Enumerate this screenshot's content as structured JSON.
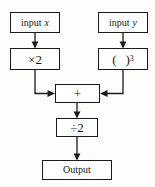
{
  "diagram": {
    "type": "flowchart",
    "stroke_color": "#1b1b1b",
    "background_color": "#fdfdfc",
    "nodes": {
      "input_x": {
        "label_prefix": "input",
        "variable": "x"
      },
      "input_y": {
        "label_prefix": "input",
        "variable": "y"
      },
      "times_two": {
        "label": "×2"
      },
      "cube": {
        "open_paren": "(",
        "close_paren": ")",
        "exponent": "3"
      },
      "sum": {
        "label": "+"
      },
      "divide": {
        "label": "÷2"
      },
      "output": {
        "label": "Output"
      }
    },
    "edges": [
      {
        "from": "input_x",
        "to": "times_two",
        "style": "arrow-down"
      },
      {
        "from": "input_y",
        "to": "cube",
        "style": "arrow-down"
      },
      {
        "from": "times_two",
        "to": "sum",
        "style": "elbow-down-right-arrow"
      },
      {
        "from": "cube",
        "to": "sum",
        "style": "elbow-down-left-arrow"
      },
      {
        "from": "sum",
        "to": "divide",
        "style": "arrow-down"
      },
      {
        "from": "divide",
        "to": "output",
        "style": "arrow-down"
      }
    ]
  }
}
